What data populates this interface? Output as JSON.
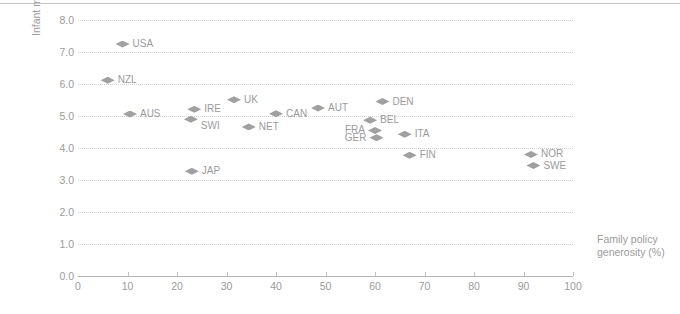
{
  "chart_data": {
    "type": "scatter",
    "title": "",
    "xlabel": "Family policy generosity (%)",
    "ylabel": "Infant mortality (per 1000 births)",
    "xlim": [
      0,
      100
    ],
    "ylim": [
      0,
      8
    ],
    "xticks": [
      "0",
      "10",
      "20",
      "30",
      "40",
      "50",
      "60",
      "70",
      "80",
      "90",
      "100"
    ],
    "yticks": [
      "0.0",
      "1.0",
      "2.0",
      "3.0",
      "4.0",
      "5.0",
      "6.0",
      "7.0",
      "8.0"
    ],
    "grid": "horizontal-dotted",
    "legend": "none",
    "marker": "diamond",
    "marker_color": "#a0a0a0",
    "points": [
      {
        "label": "USA",
        "x": 9.0,
        "y": 7.25,
        "label_pos": "right"
      },
      {
        "label": "NZL",
        "x": 6.0,
        "y": 6.12,
        "label_pos": "right"
      },
      {
        "label": "AUS",
        "x": 10.5,
        "y": 5.06,
        "label_pos": "right"
      },
      {
        "label": "JAP",
        "x": 23.0,
        "y": 3.27,
        "label_pos": "right"
      },
      {
        "label": "IRE",
        "x": 23.5,
        "y": 5.21,
        "label_pos": "right"
      },
      {
        "label": "SWI",
        "x": 22.8,
        "y": 4.9,
        "label_pos": "below"
      },
      {
        "label": "UK",
        "x": 31.5,
        "y": 5.51,
        "label_pos": "right"
      },
      {
        "label": "NET",
        "x": 34.5,
        "y": 4.66,
        "label_pos": "right"
      },
      {
        "label": "CAN",
        "x": 40.0,
        "y": 5.07,
        "label_pos": "right"
      },
      {
        "label": "AUT",
        "x": 48.5,
        "y": 5.25,
        "label_pos": "right"
      },
      {
        "label": "DEN",
        "x": 61.5,
        "y": 5.45,
        "label_pos": "right"
      },
      {
        "label": "BEL",
        "x": 59.0,
        "y": 4.87,
        "label_pos": "right"
      },
      {
        "label": "FRA",
        "x": 60.0,
        "y": 4.55,
        "label_pos": "left"
      },
      {
        "label": "GER",
        "x": 60.3,
        "y": 4.32,
        "label_pos": "left"
      },
      {
        "label": "ITA",
        "x": 66.0,
        "y": 4.43,
        "label_pos": "right"
      },
      {
        "label": "FIN",
        "x": 67.0,
        "y": 3.77,
        "label_pos": "right"
      },
      {
        "label": "NOR",
        "x": 91.5,
        "y": 3.8,
        "label_pos": "right"
      },
      {
        "label": "SWE",
        "x": 92.0,
        "y": 3.45,
        "label_pos": "right"
      }
    ]
  }
}
